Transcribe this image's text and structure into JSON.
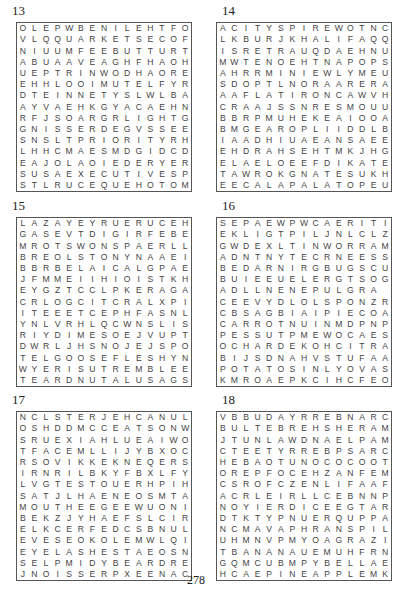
{
  "page": {
    "number": "278"
  },
  "puzzles": [
    {
      "number": "13",
      "rows": [
        "OLEPWBENILEHTFO",
        "VLQQUARKETSECOF",
        "NIUUMFEEBUTTURT",
        "ABUAAVEAGHFHAOH",
        "UEPTRINWODHAORE",
        "EHHLOOIMUTELFYR",
        "DTEINNETYSLWLBA",
        "AYVAEHKGYACAEHN",
        "RFJSOARGRLIGHTG",
        "GNISSERDEGVSSEE",
        "SNSLTPRIORITYRH",
        "LHHCMAESMDGIDCD",
        "EAJOLAOIEDERYER",
        "SUSAEXECUTIVESP",
        "STLRUCEQUEHOTOM"
      ]
    },
    {
      "number": "14",
      "rows": [
        "ACITYSPIREWOTNC",
        "LKBURJKHALIFAQQ",
        "ISRETRAUQDAEHNU",
        "MWTENOEHTNAPOPS",
        "AHRRMINIEWLYMEU",
        "SDOPTLNORAARERA",
        "AAFLATIRONCAWVH",
        "CRAAJSSNRESMOUU",
        "BBRPMUHEKEAIOOA",
        "BMGEAROPLIIDDLB",
        "IAADHIUAEANSAEE",
        "EHDRAHSEHTMKJHG",
        "ELAELOEEFDIKATE",
        "TAWROKGNATESUKH",
        "EECALAPALATOPEU"
      ]
    },
    {
      "number": "15",
      "rows": [
        "LAZAYEYRUERUCEH",
        "GASEVTDIGIRFEBE",
        "MROTSWONSPAERLL",
        "BREOLSTONYNAAEI",
        "BBRBELAICALGPAE",
        "JFMMEIIHIOISTKH",
        "EYGZTCCLPKERAGA",
        "CRLOGCITCRALXPI",
        "ITEEETCEPHFASNL",
        "YNLVRHLQCWNSLIS",
        "RIYDIMESOEJVUPT",
        "DWRLJHSNOJEJSPO",
        "TELGOOSEFLESHYN",
        "WYERISUTREMBLEE",
        "TEARDNUTALUSAGS"
      ]
    },
    {
      "number": "16",
      "rows": [
        "SEPAEWPWCAERITI",
        "EKLIGTPILJNLCLZ",
        "GWDEXLTINWORRAM",
        "ADNTNYTECRNEESS",
        "BEDARNIRGBUGSCU",
        "BUIEEUELERGTSOG",
        "ADLLNENEPULGRA",
        "CEEVYDLOLSPONZR",
        "CBSAGBIAIPIECOA",
        "CARROTNUINMDPNP",
        "PESSUTPMEWOCAES",
        "OCHARDEKOHCITRA",
        "BIJSDNAHVSTUFAA",
        "POTATOSINLYOVAS",
        "KMROAEPKCIHCFEO"
      ]
    },
    {
      "number": "17",
      "rows": [
        "NCLSTERJEHCANUL",
        "OSHDDMCCEATSONW",
        "SRUEXIAHLUEAIWO",
        "TFACEMLLIJYBXOC",
        "RSOVIKKEKNEQERS",
        "IRNRILBKYFBXLFY",
        "LVGTESTOUERHPIH",
        "SATJLHAENEOSMTA",
        "MOUTHEEGEEWUONI",
        "BEKZJYHAEFSLCIR",
        "ELKCERFEDCSBNUL",
        "EVESEOKOLEMWLQI",
        "EYELASHESTAEOSN",
        "SELPMIDYBEARDRE",
        "JNOISSERPXEENAC"
      ]
    },
    {
      "number": "18",
      "rows": [
        "VBBUDAYRREBNARC",
        "BULTEBREHSHERAM",
        "JTUNLAWDNAELPAM",
        "CTEETYRREBPSARC",
        "HEBAOTUNOCOCOOT",
        "OREPFOCEHZANFEM",
        "CSROFCZENLIFAAF",
        "ACRLEIRLLCEBNNP",
        "NOYIERDICEEGTAR",
        "DTKTYPNUERQUPPA",
        "NCMAVAPHRANSPIL",
        "UHMNVPMYOAGRAZI",
        "TBANANAUEMUHFRN",
        "GQMCUBMPYBELLAE",
        "HCAEPINEAPPLEMK"
      ]
    }
  ]
}
